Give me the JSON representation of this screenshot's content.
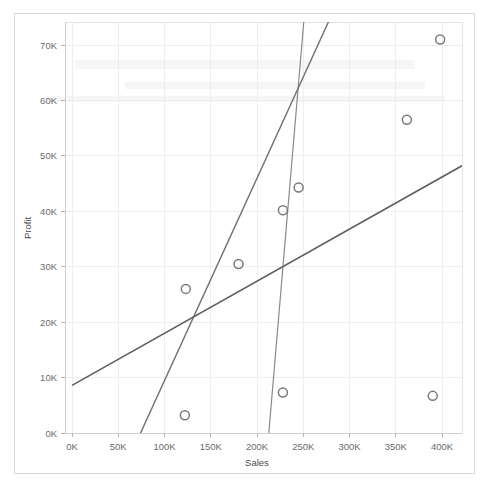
{
  "chart_data": {
    "type": "scatter",
    "title": "",
    "xlabel": "Sales",
    "ylabel": "Profit",
    "xlim": [
      0,
      430000
    ],
    "ylim": [
      -3000,
      76000
    ],
    "grid": true,
    "legend": "none",
    "x_tick_labels": [
      "0K",
      "50K",
      "100K",
      "150K",
      "200K",
      "250K",
      "300K",
      "350K",
      "400K"
    ],
    "x_tick_values": [
      0,
      50000,
      100000,
      150000,
      200000,
      250000,
      300000,
      350000,
      400000
    ],
    "y_tick_labels": [
      "0K",
      "10K",
      "20K",
      "30K",
      "40K",
      "50K",
      "60K",
      "70K"
    ],
    "y_tick_values": [
      0,
      10000,
      20000,
      30000,
      40000,
      50000,
      60000,
      70000
    ],
    "points": [
      {
        "x": 123000,
        "y": 26000
      },
      {
        "x": 122000,
        "y": 3200
      },
      {
        "x": 180000,
        "y": 30500
      },
      {
        "x": 228000,
        "y": 40200
      },
      {
        "x": 245000,
        "y": 44300
      },
      {
        "x": 228000,
        "y": 7300
      },
      {
        "x": 362000,
        "y": 56500
      },
      {
        "x": 390000,
        "y": 6700
      },
      {
        "x": 398000,
        "y": 71000
      }
    ],
    "marker": {
      "shape": "circle",
      "filled": false,
      "stroke_color": "#7a7a7a",
      "radius": 4.5
    },
    "trend_lines": [
      {
        "name": "steep-line",
        "color": "#8a8a8a",
        "width": 1.2,
        "x_start": 212000,
        "y_start": -1500,
        "x_end": 252000,
        "y_end": 77000
      },
      {
        "name": "mid-line",
        "color": "#6f6f6f",
        "width": 1.4,
        "x_start": 70000,
        "y_start": -1500,
        "x_end": 285000,
        "y_end": 77000
      },
      {
        "name": "shallow-line",
        "color": "#5f5f5f",
        "width": 1.6,
        "x_start": 0,
        "y_start": 8600,
        "x_end": 430000,
        "y_end": 49000
      }
    ]
  },
  "axes": {
    "x_title": "Sales",
    "y_title": "Profit"
  }
}
